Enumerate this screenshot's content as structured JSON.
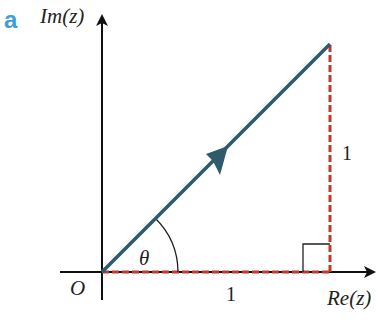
{
  "figure": {
    "part_label": "a",
    "colors": {
      "axes": "#111111",
      "vector": "#2e5a6b",
      "dashed": "#c0392b",
      "part_label": "#3ba0d8"
    },
    "labels": {
      "imag_axis": "Im(z)",
      "real_axis": "Re(z)",
      "origin": "O",
      "angle": "θ",
      "horizontal_side": "1",
      "vertical_side": "1"
    },
    "geometry": {
      "origin": [
        102,
        272
      ],
      "vector_tip": [
        330,
        44
      ],
      "real_component": 1,
      "imag_component": 1
    }
  }
}
